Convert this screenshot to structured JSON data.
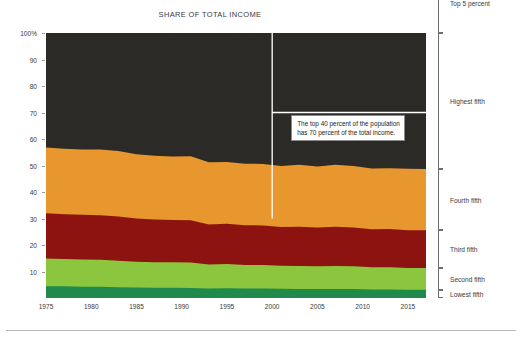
{
  "chart_data": {
    "type": "area",
    "title": "SHARE OF TOTAL INCOME",
    "xlabel": "",
    "ylabel": "",
    "xlim": [
      1975,
      2017
    ],
    "ylim": [
      0,
      100
    ],
    "grid": false,
    "stacked": true,
    "legend_position": "right",
    "y_ticks": [
      "100%",
      "90",
      "80",
      "70",
      "60",
      "50",
      "40",
      "30",
      "20",
      "10"
    ],
    "y_tick_values": [
      100,
      90,
      80,
      70,
      60,
      50,
      40,
      30,
      20,
      10
    ],
    "x_ticks": [
      "1975",
      "1980",
      "1985",
      "1990",
      "1995",
      "2000",
      "2005",
      "2010",
      "2015"
    ],
    "x_tick_values": [
      1975,
      1980,
      1985,
      1990,
      1995,
      2000,
      2005,
      2010,
      2015
    ],
    "x": [
      1975,
      1977,
      1979,
      1981,
      1983,
      1985,
      1987,
      1989,
      1991,
      1993,
      1995,
      1997,
      1999,
      2001,
      2003,
      2005,
      2007,
      2009,
      2011,
      2013,
      2015,
      2017
    ],
    "series": [
      {
        "name": "Lowest fifth",
        "color": "#1f8a4c",
        "values": [
          4.4,
          4.4,
          4.2,
          4.2,
          4.1,
          4.0,
          3.9,
          3.9,
          3.8,
          3.6,
          3.7,
          3.6,
          3.6,
          3.5,
          3.4,
          3.4,
          3.4,
          3.4,
          3.2,
          3.2,
          3.1,
          3.1
        ]
      },
      {
        "name": "Second fifth",
        "color": "#8cc63e",
        "values": [
          10.5,
          10.3,
          10.3,
          10.2,
          10.0,
          9.7,
          9.6,
          9.6,
          9.6,
          9.0,
          9.1,
          8.9,
          8.9,
          8.7,
          8.7,
          8.6,
          8.7,
          8.6,
          8.4,
          8.4,
          8.2,
          8.2
        ]
      },
      {
        "name": "Third fifth",
        "color": "#8c1310",
        "values": [
          17.1,
          16.9,
          16.9,
          16.8,
          16.7,
          16.3,
          16.1,
          15.9,
          15.9,
          15.1,
          15.2,
          15.0,
          14.9,
          14.6,
          14.8,
          14.6,
          14.8,
          14.6,
          14.3,
          14.4,
          14.3,
          14.3
        ]
      },
      {
        "name": "Fourth fifth",
        "color": "#e8962e",
        "values": [
          24.8,
          24.7,
          24.6,
          24.8,
          24.7,
          24.2,
          24.1,
          24.0,
          24.2,
          23.5,
          23.3,
          23.2,
          23.2,
          23.0,
          23.4,
          23.0,
          23.4,
          23.2,
          23.0,
          23.0,
          23.2,
          23.1
        ]
      },
      {
        "name": "Highest fifth",
        "color": "#2b2a26",
        "values": [
          43.2,
          43.7,
          44.0,
          44.0,
          44.5,
          45.8,
          46.3,
          46.6,
          46.5,
          48.8,
          48.7,
          49.3,
          49.4,
          50.2,
          49.7,
          50.4,
          49.7,
          50.2,
          51.1,
          51.0,
          51.2,
          51.3
        ]
      },
      {
        "name": "Top 5 percent",
        "color": "#a8c4cc",
        "hatch": true,
        "values": [
          15.9,
          16.0,
          16.4,
          16.5,
          17.0,
          17.6,
          18.2,
          18.9,
          18.1,
          20.3,
          21.0,
          21.7,
          21.5,
          22.4,
          21.4,
          22.2,
          21.2,
          21.7,
          22.3,
          22.2,
          22.1,
          22.3
        ]
      }
    ],
    "annotations": [
      {
        "name": "top-40-callout",
        "text_line1": "The top 40 percent of the population",
        "text_line2": "has 70 percent of the total income.",
        "marker_year": 2000,
        "marker_value": 70
      }
    ]
  },
  "legend": {
    "items": [
      {
        "label": "Top 5 percent"
      },
      {
        "label": "Highest fifth"
      },
      {
        "label": "Fourth fifth"
      },
      {
        "label": "Third fifth"
      },
      {
        "label": "Second fifth"
      },
      {
        "label": "Lowest fifth"
      }
    ]
  }
}
